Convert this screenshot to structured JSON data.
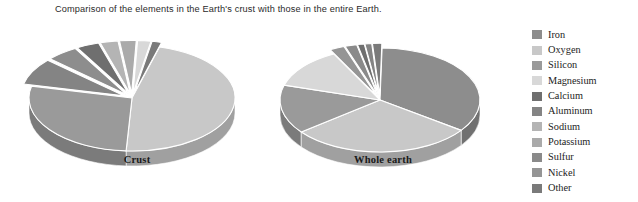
{
  "caption": "Comparison of the elements in the Earth's crust with those in the entire Earth.",
  "legend": {
    "items": [
      {
        "label": "Iron",
        "color": "#8d8d8d"
      },
      {
        "label": "Oxygen",
        "color": "#c8c8c8"
      },
      {
        "label": "Silicon",
        "color": "#9a9a9a"
      },
      {
        "label": "Magnesium",
        "color": "#d8d8d8"
      },
      {
        "label": "Calcium",
        "color": "#6f6f6f"
      },
      {
        "label": "Aluminum",
        "color": "#848484"
      },
      {
        "label": "Sodium",
        "color": "#b4b4b4"
      },
      {
        "label": "Potassium",
        "color": "#aaaaaa"
      },
      {
        "label": "Sulfur",
        "color": "#8a8a8a"
      },
      {
        "label": "Nickel",
        "color": "#959595"
      },
      {
        "label": "Other",
        "color": "#7a7a7a"
      }
    ]
  },
  "charts": {
    "crust": {
      "label": "Crust"
    },
    "whole_earth": {
      "label": "Whole earth"
    }
  },
  "chart_data": [
    {
      "type": "pie",
      "title": "Crust",
      "subtitle": "",
      "xlabel": "",
      "ylabel": "",
      "unit": "percent by mass",
      "exploded": true,
      "three_d": true,
      "legend_position": "right",
      "grid": false,
      "categories": [
        "Oxygen",
        "Silicon",
        "Aluminum",
        "Iron",
        "Calcium",
        "Sodium",
        "Potassium",
        "Magnesium",
        "Other"
      ],
      "values": [
        46.6,
        27.7,
        8.1,
        5.0,
        3.6,
        2.8,
        2.6,
        2.1,
        1.5
      ],
      "colors": [
        "#c8c8c8",
        "#9a9a9a",
        "#848484",
        "#8d8d8d",
        "#6f6f6f",
        "#b4b4b4",
        "#aaaaaa",
        "#d8d8d8",
        "#7a7a7a"
      ]
    },
    {
      "type": "pie",
      "title": "Whole earth",
      "subtitle": "",
      "xlabel": "",
      "ylabel": "",
      "unit": "percent by mass",
      "exploded": true,
      "three_d": true,
      "legend_position": "right",
      "grid": false,
      "categories": [
        "Iron",
        "Oxygen",
        "Silicon",
        "Magnesium",
        "Nickel",
        "Sulfur",
        "Calcium",
        "Aluminum",
        "Other"
      ],
      "values": [
        34.6,
        29.5,
        15.2,
        12.7,
        2.4,
        1.9,
        1.1,
        1.1,
        1.5
      ],
      "colors": [
        "#8d8d8d",
        "#c8c8c8",
        "#9a9a9a",
        "#d8d8d8",
        "#959595",
        "#8a8a8a",
        "#6f6f6f",
        "#848484",
        "#7a7a7a"
      ]
    }
  ]
}
